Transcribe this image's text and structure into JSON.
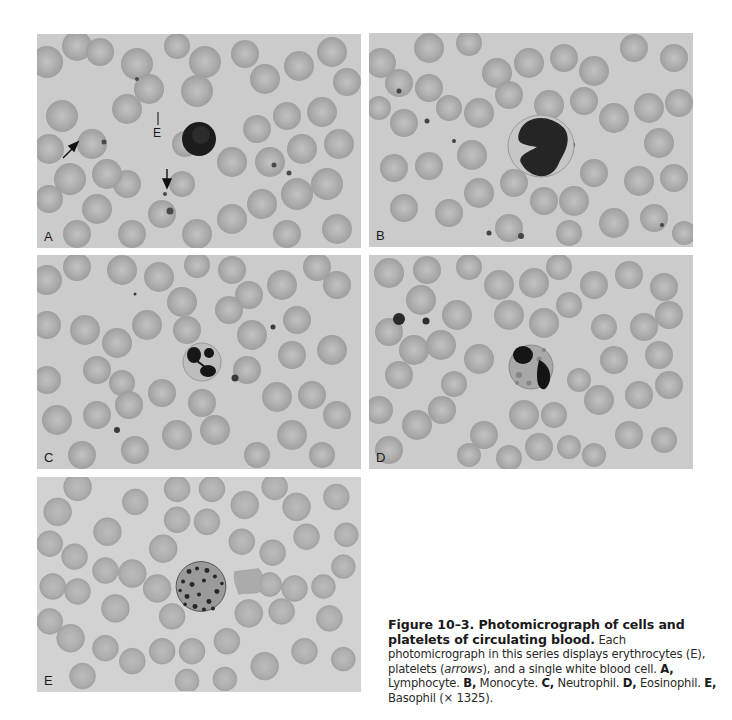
{
  "figure": {
    "number": "Figure 10–3.",
    "title_line1": "Figure 10–3. Photomicrograph of cells and",
    "title_line2": "platelets of circulating blood.",
    "caption_intro": " Each photomicrograph in this series displays erythrocytes (E), platelets (",
    "caption_arrows": "arrows",
    "caption_after_arrows": "), and a single white blood cell. ",
    "items": [
      {
        "label": "A,",
        "text": " Lymphocyte. "
      },
      {
        "label": "B,",
        "text": " Monocyte. "
      },
      {
        "label": "C,",
        "text": " Neutrophil. "
      },
      {
        "label": "D,",
        "text": " Eosinophil. "
      },
      {
        "label": "E,",
        "text": " Basophil (× 1325)."
      }
    ]
  },
  "panels": [
    {
      "id": "A",
      "label": "A",
      "cell_type": "Lymphocyte",
      "annotation": "E"
    },
    {
      "id": "B",
      "label": "B",
      "cell_type": "Monocyte"
    },
    {
      "id": "C",
      "label": "C",
      "cell_type": "Neutrophil"
    },
    {
      "id": "D",
      "label": "D",
      "cell_type": "Eosinophil"
    },
    {
      "id": "E",
      "label": "E",
      "cell_type": "Basophil"
    }
  ],
  "colors": {
    "background": "#cbcbcb",
    "erythrocyte": "#a9a9a9",
    "erythrocyte_center": "#bdbdbd",
    "nucleus": "#1e1e1e"
  }
}
